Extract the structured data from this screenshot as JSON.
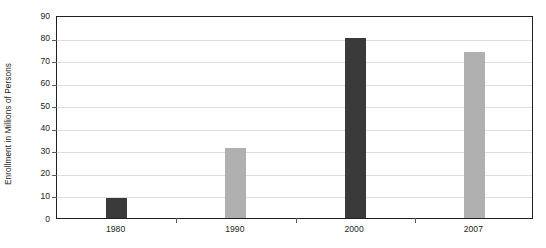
{
  "chart_data": {
    "type": "bar",
    "title": "",
    "xlabel": "",
    "ylabel": "Enrollment in Millions of Persons",
    "categories": [
      "1980",
      "1990",
      "2000",
      "2007"
    ],
    "values": [
      9,
      31,
      80,
      73.5
    ],
    "bar_colors": [
      "#3a3a3a",
      "#b0b0b0",
      "#3a3a3a",
      "#b0b0b0"
    ],
    "ylim": [
      0,
      90
    ],
    "ytick_interval": 10,
    "ytick_labels": [
      "0",
      "10",
      "20",
      "30",
      "40",
      "50",
      "60",
      "70",
      "80",
      "90"
    ],
    "grid": true,
    "legend": "none",
    "frame_color": "#231f20",
    "gridline_color": "#dedede",
    "background": "#ffffff"
  },
  "axes": {
    "y_title": "Enrollment in Millions of Persons"
  }
}
